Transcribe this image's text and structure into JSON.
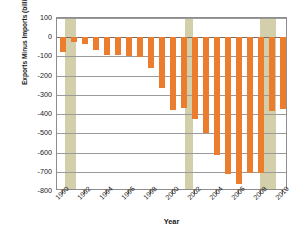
{
  "chart_data": {
    "type": "bar",
    "title": "",
    "xlabel": "Year",
    "ylabel": "Exports Minus Imports (billions of  dollars)",
    "ylim": [
      -800,
      100
    ],
    "ytick_values": [
      100,
      0,
      -100,
      -200,
      -300,
      -400,
      -500,
      -600,
      -700,
      -800
    ],
    "ytick_labels": [
      "100",
      "0",
      "-100",
      "-200",
      "-300",
      "-400",
      "-500",
      "-600",
      "-700",
      "-800"
    ],
    "xlim": [
      1989.5,
      2010.5
    ],
    "xtick_labels": [
      "1990",
      "1992",
      "1994",
      "1996",
      "1998",
      "2000",
      "2002",
      "2004",
      "2006",
      "2008",
      "2010"
    ],
    "xtick_values": [
      1990,
      1992,
      1994,
      1996,
      1998,
      2000,
      2002,
      2004,
      2006,
      2008,
      2010
    ],
    "grid": true,
    "legend": "none",
    "categories": [
      "1990",
      "1991",
      "1992",
      "1993",
      "1994",
      "1995",
      "1996",
      "1997",
      "1998",
      "1999",
      "2000",
      "2001",
      "2002",
      "2003",
      "2004",
      "2005",
      "2006",
      "2007",
      "2008",
      "2009",
      "2010"
    ],
    "values": [
      -77,
      -27,
      -33,
      -65,
      -93,
      -91,
      -96,
      -101,
      -160,
      -262,
      -379,
      -367,
      -424,
      -499,
      -615,
      -714,
      -762,
      -705,
      -708,
      -384,
      -375
    ],
    "bar_color": "#ec7c2e",
    "annotations": [
      {
        "label": "recession",
        "start": 1990.25,
        "end": 1991.2,
        "color": "#d3cfab"
      },
      {
        "label": "recession",
        "start": 2001.1,
        "end": 2001.85,
        "color": "#d3cfab"
      },
      {
        "label": "recession",
        "start": 2007.95,
        "end": 2009.4,
        "color": "#d3cfab"
      }
    ]
  }
}
